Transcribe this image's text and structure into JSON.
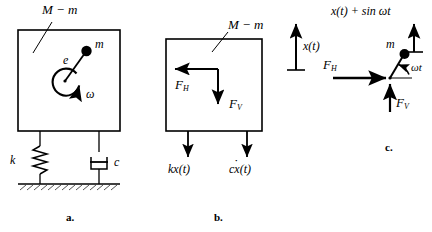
{
  "figure": {
    "line_color": "#000000",
    "background": "#ffffff"
  },
  "panel_a": {
    "caption": "a.",
    "body_label": "M − m",
    "eccentricity_label": "e",
    "mass_label": "m",
    "angular_velocity_label": "ω",
    "spring_label": "k",
    "damper_label": "c"
  },
  "panel_b": {
    "caption": "b.",
    "body_label": "M − m",
    "displacement_label": "x(t)",
    "horizontal_force_label": "F",
    "horizontal_force_sub": "H",
    "vertical_force_label": "F",
    "vertical_force_sub": "V",
    "spring_force_label": "kx(t)",
    "damper_force_label": "c",
    "damper_force_var": "x",
    "damper_force_tail": "(t)"
  },
  "panel_c": {
    "caption": "c.",
    "displacement_label": "x(t) + sin ωt",
    "mass_label": "m",
    "angle_label": "ωt",
    "horizontal_force_label": "F",
    "horizontal_force_sub": "H",
    "vertical_force_label": "F",
    "vertical_force_sub": "V"
  }
}
